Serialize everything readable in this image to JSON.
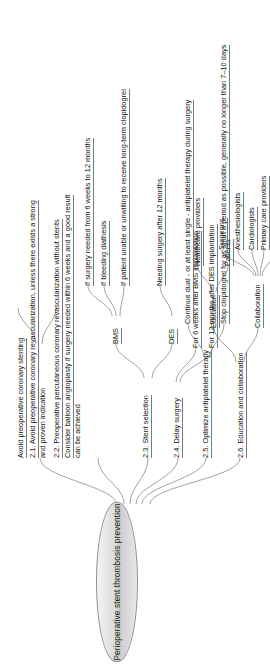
{
  "diagram": {
    "type": "mind-map",
    "orientation": "rotated-90-ccw",
    "root": {
      "label": "Perioperative stent thrombosis prevention"
    },
    "branches": [
      {
        "id": "b21",
        "label": "2.1. Avoid preoperative coronary revascularization, unless there exists a strong and proven indication",
        "line1": "2.1. Avoid preoperative coronary revascularization, unless there exists a strong",
        "line2": "and proven indication",
        "children": []
      },
      {
        "id": "b22",
        "label": "2.2. Preoperative percutaneous coronary revascularization without stents",
        "line1": "2.2. Preoperative percutaneous coronary revascularization without stents",
        "children": [
          {
            "id": "b22c1",
            "line1": "Consider balloon angioplasty if surgery needed within 6 weeks and a good result",
            "line2": "can be achieved"
          }
        ]
      },
      {
        "id": "b23",
        "label": "2.3. Stent selection",
        "children": [
          {
            "id": "bms",
            "label": "BMS",
            "children": [
              {
                "id": "bms1",
                "label": "If surgery needed from 6 weeks to 12 months"
              },
              {
                "id": "bms2",
                "label": "If bleeding diathesis"
              },
              {
                "id": "bms3",
                "label": "If patient unable or unwilling to receive long-term clopidogrel"
              }
            ]
          },
          {
            "id": "des",
            "label": "DES",
            "children": [
              {
                "id": "des1",
                "label": "Needing surgery after 12 months"
              }
            ]
          }
        ]
      },
      {
        "id": "b24",
        "label": "2.4. Delay surgery",
        "children": [
          {
            "id": "b24c1",
            "label": "For 6 weeks after BMS implantation"
          },
          {
            "id": "b24c2",
            "label": "For 12 months after DES implantation"
          }
        ]
      },
      {
        "id": "b25",
        "label": "2.5. Optimize antiplatelet therapy",
        "children": [
          {
            "id": "b25c1",
            "label": "Continue dual - or at least single - antiplatelet therapy during surgery"
          },
          {
            "id": "b25c2",
            "label": "Stop clopidogrel for as short a period as possible, generally no longer than 7–10 days"
          }
        ]
      },
      {
        "id": "b26",
        "label": "2.6. Education and collaboration",
        "children": [
          {
            "id": "edu",
            "label": "Education",
            "children": [
              {
                "id": "edu1",
                "label": "Healthcare providers"
              },
              {
                "id": "edu2",
                "label": "Patients"
              }
            ]
          },
          {
            "id": "col",
            "label": "Collaboration",
            "children": [
              {
                "id": "col1",
                "label": "Surgeons"
              },
              {
                "id": "col2",
                "label": "Anesthesiologists"
              },
              {
                "id": "col3",
                "label": "Cardiologists"
              },
              {
                "id": "col4",
                "label": "Primary care providers"
              },
              {
                "id": "col5",
                "label": "Surgery at center with primary PCI availability"
              }
            ]
          }
        ]
      }
    ],
    "extra_nodes": [
      {
        "id": "avoid_stent",
        "label": "Avoid preoperative coronary stenting"
      }
    ],
    "colors": {
      "root_fill_light": "#f4f4f4",
      "root_fill_dark": "#c9c9c9",
      "root_stroke": "#8e8e8e",
      "link_stroke": "#8a8a8a",
      "text": "#1a1a1a",
      "background": "#ffffff"
    }
  }
}
